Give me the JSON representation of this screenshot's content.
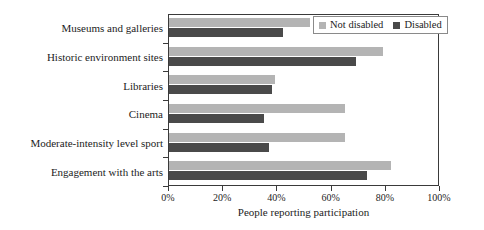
{
  "chart_data": {
    "type": "bar",
    "orientation": "horizontal",
    "title": "",
    "xlabel": "People reporting participation",
    "ylabel": "",
    "xlim": [
      0,
      100
    ],
    "xticks": [
      "0%",
      "20%",
      "40%",
      "60%",
      "80%",
      "100%"
    ],
    "xtick_values": [
      0,
      20,
      40,
      60,
      80,
      100
    ],
    "grid": false,
    "legend_position": "top-right",
    "categories": [
      "Museums and galleries",
      "Historic environment sites",
      "Libraries",
      "Cinema",
      "Moderate-intensity level sport",
      "Engagement with the arts"
    ],
    "series": [
      {
        "name": "Not disabled",
        "color": "#b4b4b4",
        "values": [
          52,
          79,
          39,
          65,
          65,
          82
        ]
      },
      {
        "name": "Disabled",
        "color": "#4a4a4a",
        "values": [
          42,
          69,
          38,
          35,
          37,
          73
        ]
      }
    ]
  },
  "legend": {
    "entries": [
      {
        "label": "Not disabled",
        "color": "#b4b4b4"
      },
      {
        "label": "Disabled",
        "color": "#4a4a4a"
      }
    ]
  }
}
